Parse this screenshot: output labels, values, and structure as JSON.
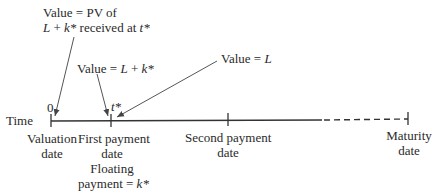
{
  "annotations": {
    "pv_value": {
      "line1": "Value = PV of",
      "line2_var": "L",
      "line2_mid": " + ",
      "line2_var2": "k*",
      "line2_rest": " received at ",
      "line2_var3": "t*"
    },
    "l_plus_k": {
      "prefix": "Value = ",
      "var1": "L",
      "mid": " + ",
      "var2": "k*"
    },
    "l_value": {
      "prefix": "Value = ",
      "var": "L"
    }
  },
  "timeline": {
    "axis_label": "Time",
    "zero_label": "0",
    "tstar_label": "t*",
    "ticks": [
      {
        "id": "valuation",
        "line1": "Valuation",
        "line2": "date"
      },
      {
        "id": "first-payment",
        "line1": "First payment",
        "line2": "date",
        "line3": "Floating",
        "line4_prefix": "payment = ",
        "line4_var": "k*"
      },
      {
        "id": "second-payment",
        "line1": "Second payment",
        "line2": "date"
      },
      {
        "id": "maturity",
        "line1": "Maturity",
        "line2": "date"
      }
    ]
  },
  "colors": {
    "line": "#333333",
    "arrow": "#555555",
    "text": "#2a2a2a"
  }
}
